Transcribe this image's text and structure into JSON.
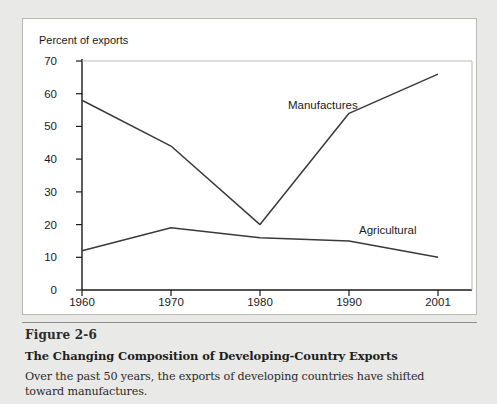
{
  "figure": {
    "number": "Figure 2-6",
    "title": "The Changing Composition of Developing-Country Exports",
    "description": "Over the past 50 years, the exports of developing countries have shifted toward manufactures."
  },
  "chart_data": {
    "type": "line",
    "title": "",
    "subtitle": "",
    "xlabel": "",
    "ylabel": "Percent of exports",
    "x": [
      "1960",
      "1970",
      "1980",
      "1990",
      "2001"
    ],
    "xlim": [
      1960,
      2001
    ],
    "ylim": [
      0,
      70
    ],
    "yticks": [
      "0",
      "10",
      "20",
      "30",
      "40",
      "50",
      "60",
      "70"
    ],
    "xticks": [
      "1960",
      "1970",
      "1980",
      "1990",
      "2001"
    ],
    "grid": false,
    "legend_position": "inline-annotation",
    "series": [
      {
        "name": "Manufactures",
        "values": [
          58,
          44,
          20,
          54,
          66
        ],
        "color": "#3a3a3a"
      },
      {
        "name": "Agricultural",
        "values": [
          12,
          19,
          16,
          15,
          10
        ],
        "color": "#3a3a3a"
      }
    ],
    "annotations": [
      {
        "text": "Manufactures",
        "x": "1980",
        "y": 52
      },
      {
        "text": "Agricultural",
        "x": "1990",
        "y": 22
      }
    ]
  },
  "axis": {
    "y_title": "Percent of exports"
  },
  "colors": {
    "line": "#3a3a3a",
    "axis": "#1a1a1a",
    "panel_background": "#ffffff",
    "page_background": "#e9e9e7",
    "panel_border": "#b9b9b6",
    "divider": "#8d8d8a",
    "text": "#1a1a1a"
  }
}
